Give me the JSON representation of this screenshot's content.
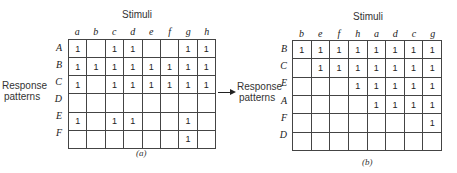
{
  "figure": {
    "left": {
      "stimuli_label": "Stimuli",
      "response_label_line1": "Response",
      "response_label_line2": "patterns",
      "caption": "(a)",
      "columns": [
        "a",
        "b",
        "c",
        "d",
        "e",
        "f",
        "g",
        "h"
      ],
      "rows": [
        {
          "label": "A",
          "cells": [
            "1",
            "",
            "1",
            "1",
            "",
            "",
            "1",
            "1"
          ]
        },
        {
          "label": "B",
          "cells": [
            "1",
            "1",
            "1",
            "1",
            "1",
            "1",
            "1",
            "1"
          ]
        },
        {
          "label": "C",
          "cells": [
            "1",
            "",
            "1",
            "1",
            "1",
            "1",
            "1",
            "1"
          ]
        },
        {
          "label": "D",
          "cells": [
            "",
            "",
            "",
            "",
            "",
            "",
            "",
            ""
          ]
        },
        {
          "label": "E",
          "cells": [
            "1",
            "",
            "1",
            "1",
            "",
            "",
            "1",
            ""
          ]
        },
        {
          "label": "F",
          "cells": [
            "",
            "",
            "",
            "",
            "",
            "",
            "1",
            ""
          ]
        }
      ]
    },
    "right": {
      "stimuli_label": "Stimuli",
      "response_label_line1": "Response",
      "response_label_line2": "patterns",
      "caption": "(b)",
      "columns": [
        "b",
        "e",
        "f",
        "h",
        "a",
        "d",
        "c",
        "g"
      ],
      "rows": [
        {
          "label": "B",
          "cells": [
            "1",
            "1",
            "1",
            "1",
            "1",
            "1",
            "1",
            "1"
          ]
        },
        {
          "label": "C",
          "cells": [
            "",
            "1",
            "1",
            "1",
            "1",
            "1",
            "1",
            "1"
          ]
        },
        {
          "label": "E",
          "cells": [
            "",
            "",
            "",
            "1",
            "1",
            "1",
            "1",
            "1"
          ]
        },
        {
          "label": "A",
          "cells": [
            "",
            "",
            "",
            "",
            "1",
            "1",
            "1",
            "1"
          ]
        },
        {
          "label": "F",
          "cells": [
            "",
            "",
            "",
            "",
            "",
            "",
            "",
            "1"
          ]
        },
        {
          "label": "D",
          "cells": [
            "",
            "",
            "",
            "",
            "",
            "",
            "",
            ""
          ]
        }
      ]
    },
    "arrow": {
      "direction": "right"
    }
  }
}
